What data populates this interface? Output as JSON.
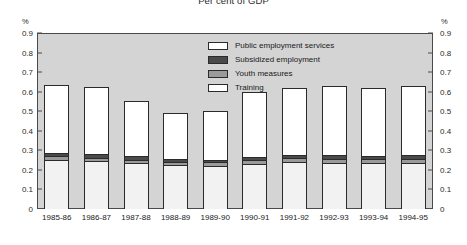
{
  "chart_data": {
    "type": "bar",
    "subtype": "stacked-column",
    "title": "Per cent of GDP",
    "xlabel": "",
    "ylabel": "%",
    "ylabel_right": "%",
    "ylim": [
      0,
      0.9
    ],
    "ytick_values": [
      0,
      0.1,
      0.2,
      0.3,
      0.4,
      0.5,
      0.6,
      0.7,
      0.8,
      0.9
    ],
    "ytick_labels": [
      "0",
      "0.1",
      "0.2",
      "0.3",
      "0.4",
      "0.5",
      "0.6",
      "0.7",
      "0.8",
      "0.9"
    ],
    "grid": false,
    "legend_position": "inside-top-center",
    "plot_background": "#d4d4d4",
    "categories": [
      "1985-86",
      "1986-87",
      "1987-88",
      "1988-89",
      "1989-90",
      "1990-91",
      "1991-92",
      "1992-93",
      "1993-94",
      "1994-95"
    ],
    "series": [
      {
        "name": "Training",
        "color": "#f2f2f2",
        "values": [
          0.245,
          0.24,
          0.23,
          0.22,
          0.218,
          0.228,
          0.235,
          0.232,
          0.23,
          0.232
        ]
      },
      {
        "name": "Youth measures",
        "color": "#9a9a9a",
        "values": [
          0.022,
          0.02,
          0.02,
          0.018,
          0.018,
          0.02,
          0.022,
          0.022,
          0.022,
          0.022
        ]
      },
      {
        "name": "Subsidized employment",
        "color": "#4a4a4a",
        "values": [
          0.018,
          0.018,
          0.016,
          0.014,
          0.014,
          0.016,
          0.018,
          0.018,
          0.018,
          0.018
        ]
      },
      {
        "name": "Public employment services",
        "color": "#ffffff",
        "values": [
          0.35,
          0.347,
          0.284,
          0.238,
          0.25,
          0.336,
          0.345,
          0.358,
          0.35,
          0.358
        ]
      }
    ],
    "totals": [
      0.635,
      0.625,
      0.55,
      0.49,
      0.5,
      0.6,
      0.62,
      0.63,
      0.62,
      0.63
    ]
  },
  "legend": {
    "items": [
      {
        "label": "Public employment services",
        "color": "#ffffff"
      },
      {
        "label": "Subsidized employment",
        "color": "#4a4a4a"
      },
      {
        "label": "Youth measures",
        "color": "#9a9a9a"
      },
      {
        "label": "Training",
        "color": "#ffffff"
      }
    ]
  }
}
